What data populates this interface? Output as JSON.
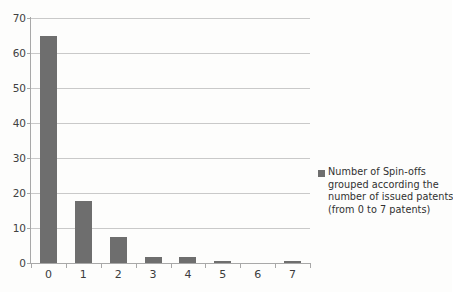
{
  "chart_data": {
    "type": "bar",
    "title": "",
    "subtitle": "",
    "xlabel": "",
    "ylabel": "",
    "categories": [
      "0",
      "1",
      "2",
      "3",
      "4",
      "5",
      "6",
      "7"
    ],
    "values": [
      65,
      17.7,
      7.5,
      1.8,
      1.8,
      0.7,
      0,
      0.5
    ],
    "series": [
      {
        "name": "Number of Spin-offs grouped according the number of issued patents (from 0 to 7 patents)",
        "values": [
          65,
          17.7,
          7.5,
          1.8,
          1.8,
          0.7,
          0,
          0.5
        ]
      }
    ],
    "ylim": [
      0,
      70
    ],
    "xlim": [
      0,
      8
    ],
    "y_ticks": [
      0,
      10,
      20,
      30,
      40,
      50,
      60,
      70
    ],
    "y_tick_labels": [
      "0",
      "10",
      "20",
      "30",
      "40",
      "50",
      "60",
      "70"
    ],
    "grid": "horizontal",
    "legend_position": "right",
    "bar_color": "#6e6e6e",
    "gridline_color": "#c9c9c9",
    "axis_color": "#a8a8a8",
    "annotations": []
  },
  "legend": {
    "marker": "legend-color-swatch",
    "lines": [
      "Number of Spin-offs",
      "grouped according the",
      "number of issued patents",
      "(from 0 to 7 patents)"
    ]
  }
}
